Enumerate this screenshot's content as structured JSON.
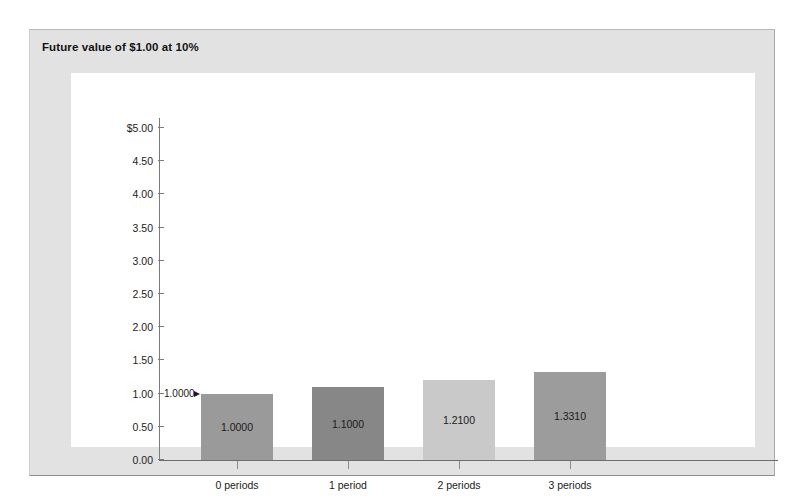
{
  "chart_data": {
    "type": "bar",
    "title": "Future value of $1.00 at 10%",
    "xlabel": "",
    "ylabel": "",
    "ylim": [
      0,
      5
    ],
    "grid": false,
    "legend": null,
    "categories": [
      "0 periods",
      "1 period",
      "2 periods",
      "3 periods"
    ],
    "values": [
      1.0,
      1.1,
      1.21,
      1.331
    ],
    "data_labels": [
      "1.0000",
      "1.1000",
      "1.2100",
      "1.3310"
    ],
    "bar_colors": [
      "#9a9a9a",
      "#878787",
      "#c9c9c9",
      "#9c9c9c"
    ],
    "ytick_values": [
      5.0,
      4.5,
      4.0,
      3.5,
      3.0,
      2.5,
      2.0,
      1.5,
      1.0,
      0.5,
      0.0
    ],
    "ytick_labels": [
      "$5.00",
      "4.50",
      "4.00",
      "3.50",
      "3.00",
      "2.50",
      "2.00",
      "1.50",
      "1.00",
      "0.50",
      "0.00"
    ],
    "annotations": [
      {
        "text": "1.0000",
        "target_category": "0 periods",
        "target_value": 1.0
      }
    ]
  },
  "frame": {
    "background_color": "#e2e2e2",
    "panel_color": "#ffffff"
  }
}
